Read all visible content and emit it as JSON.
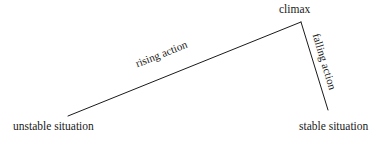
{
  "diagram": {
    "background_color": "#ffffff",
    "line_color": "#1a1a1a",
    "text_color": "#1a1a1a",
    "labels": {
      "unstable_situation": "unstable situation",
      "rising_action": "rising action",
      "climax": "climax",
      "falling_action": "falling action",
      "stable_situation": "stable situation"
    }
  },
  "chart_data": {
    "type": "line",
    "title": "",
    "xlabel": "",
    "ylabel": "",
    "grid": false,
    "legend": "none",
    "annotations": [
      "unstable situation",
      "rising action",
      "climax",
      "falling action",
      "stable situation"
    ],
    "series": [
      {
        "name": "rising action",
        "points": [
          [
            68,
            116
          ],
          [
            301,
            22
          ]
        ]
      },
      {
        "name": "falling action",
        "points": [
          [
            301,
            22
          ],
          [
            328,
            110
          ]
        ]
      }
    ]
  }
}
